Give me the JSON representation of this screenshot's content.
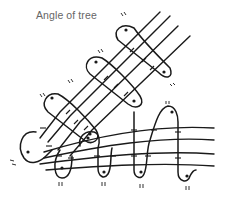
{
  "title": "Angle of tree",
  "diagram": {
    "type": "lashing-knot-diagram",
    "elements": {
      "diagonal_cords": 4,
      "horizontal_cords": 4,
      "diagonal_wraps": 3,
      "horizontal_wraps": 4,
      "loop_markers": "pairs of small tick marks near each loop end"
    },
    "colors": {
      "line": "#1a1a1a",
      "title": "#666666",
      "background": "#ffffff"
    }
  }
}
